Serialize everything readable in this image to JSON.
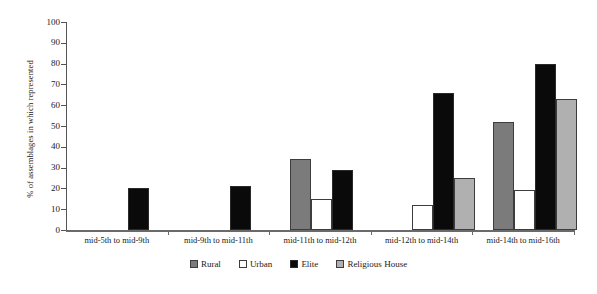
{
  "chart_data": {
    "type": "bar",
    "title": "",
    "xlabel": "",
    "ylabel": "% of assemblages in which represented",
    "ylim": [
      0,
      100
    ],
    "ytick_step": 10,
    "yticks": [
      0,
      10,
      20,
      30,
      40,
      50,
      60,
      70,
      80,
      90,
      100
    ],
    "grid": false,
    "legend_position": "bottom-center",
    "categories": [
      "mid-5th to mid-9th",
      "mid-9th to mid-11th",
      "mid-11th to mid-12th",
      "mid-12th to mid-14th",
      "mid-14th to mid-16th"
    ],
    "series": [
      {
        "name": "Rural",
        "color": "#7b7b7b",
        "values": [
          null,
          null,
          34,
          null,
          52
        ]
      },
      {
        "name": "Urban",
        "color": "#ffffff",
        "values": [
          null,
          null,
          15,
          12,
          19
        ]
      },
      {
        "name": "Elite",
        "color": "#0a0a0a",
        "values": [
          20,
          21,
          29,
          66,
          80
        ]
      },
      {
        "name": "Religious House",
        "color": "#b0b0b0",
        "values": [
          null,
          null,
          null,
          25,
          63
        ]
      }
    ]
  },
  "axis": {
    "y_title": "% of assemblages in which represented",
    "y_tick_labels": [
      "100",
      "90",
      "80",
      "70",
      "60",
      "50",
      "40",
      "30",
      "20",
      "10",
      "0"
    ]
  },
  "legend": {
    "items": [
      {
        "label": "Rural",
        "swatch": "rural-swatch-icon"
      },
      {
        "label": "Urban",
        "swatch": "urban-swatch-icon"
      },
      {
        "label": "Elite",
        "swatch": "elite-swatch-icon"
      },
      {
        "label": "Religious House",
        "swatch": "religious-house-swatch-icon"
      }
    ]
  }
}
